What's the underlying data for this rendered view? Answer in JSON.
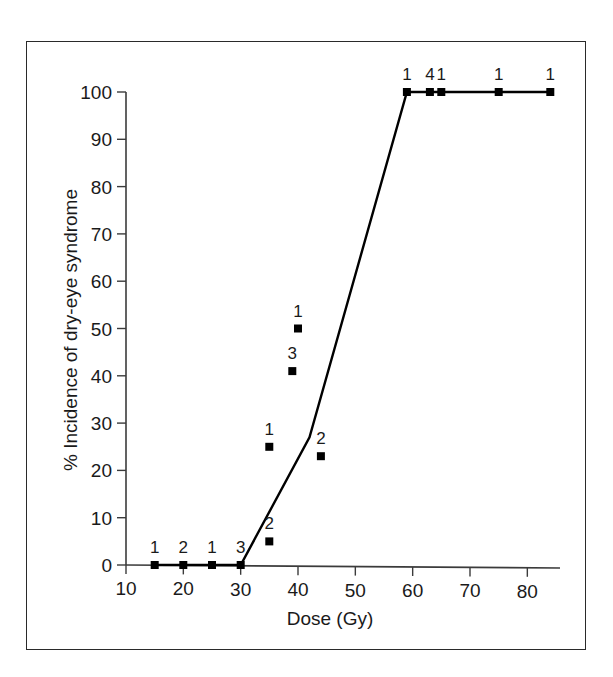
{
  "chart_data": {
    "type": "scatter",
    "title": "",
    "xlabel": "Dose (Gy)",
    "ylabel": "% Incidence of dry-eye syndrome",
    "xlim": [
      10,
      85
    ],
    "ylim": [
      0,
      100
    ],
    "xticks": [
      10,
      20,
      30,
      40,
      50,
      60,
      70,
      80
    ],
    "xtick_labels": [
      "10",
      "20",
      "30",
      "40",
      "50",
      "60",
      "70",
      "80"
    ],
    "yticks": [
      0,
      10,
      20,
      30,
      40,
      50,
      60,
      70,
      80,
      90,
      100
    ],
    "ytick_labels": [
      "0",
      "10",
      "20",
      "30",
      "40",
      "50",
      "60",
      "70",
      "80",
      "90",
      "100"
    ],
    "grid": false,
    "legend": "none",
    "marker": "square",
    "marker_color": "#000000",
    "line_color": "#000000",
    "points": [
      {
        "x": 15,
        "y": 0,
        "label": "1"
      },
      {
        "x": 20,
        "y": 0,
        "label": "2"
      },
      {
        "x": 25,
        "y": 0,
        "label": "1"
      },
      {
        "x": 30,
        "y": 0,
        "label": "3"
      },
      {
        "x": 35,
        "y": 5,
        "label": "2"
      },
      {
        "x": 35,
        "y": 25,
        "label": "1"
      },
      {
        "x": 39,
        "y": 41,
        "label": "3"
      },
      {
        "x": 40,
        "y": 50,
        "label": "1"
      },
      {
        "x": 44,
        "y": 23,
        "label": "2"
      },
      {
        "x": 59,
        "y": 100,
        "label": "1"
      },
      {
        "x": 63,
        "y": 100,
        "label": "4"
      },
      {
        "x": 65,
        "y": 100,
        "label": "1"
      },
      {
        "x": 75,
        "y": 100,
        "label": "1"
      },
      {
        "x": 84,
        "y": 100,
        "label": "1"
      }
    ],
    "fitted_line": [
      {
        "x": 15,
        "y": 0
      },
      {
        "x": 30,
        "y": 0
      },
      {
        "x": 42,
        "y": 27
      },
      {
        "x": 59,
        "y": 100
      },
      {
        "x": 84,
        "y": 100
      }
    ]
  }
}
